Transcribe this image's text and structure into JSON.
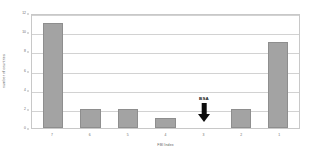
{
  "chart_data": {
    "type": "bar",
    "title": "",
    "xlabel": "FBI Index",
    "ylabel": "number of countries",
    "categories": [
      "7",
      "6",
      "5",
      "4",
      "3",
      "2",
      "1"
    ],
    "values": [
      11,
      2,
      2,
      1,
      0,
      2,
      9
    ],
    "ylim": [
      0,
      12
    ],
    "yticks": [
      0,
      2,
      4,
      6,
      8,
      10,
      12
    ],
    "grid": true,
    "legend": "none",
    "bar_color": "#a3a3a3",
    "annotations": [
      {
        "label": "BSA",
        "category": "3",
        "marker": "down-arrow",
        "color": "#0d0d0d"
      }
    ]
  },
  "colors": {
    "bar_fill": "#a3a3a3",
    "bar_border": "#8e8e8e",
    "gridline": "#d2d2d2",
    "frame": "#c8c8c8",
    "tick_text": "#6a6a6a",
    "axis_title": "#5f5f5f",
    "annotation": "#0d0d0d",
    "background": "#ffffff"
  }
}
